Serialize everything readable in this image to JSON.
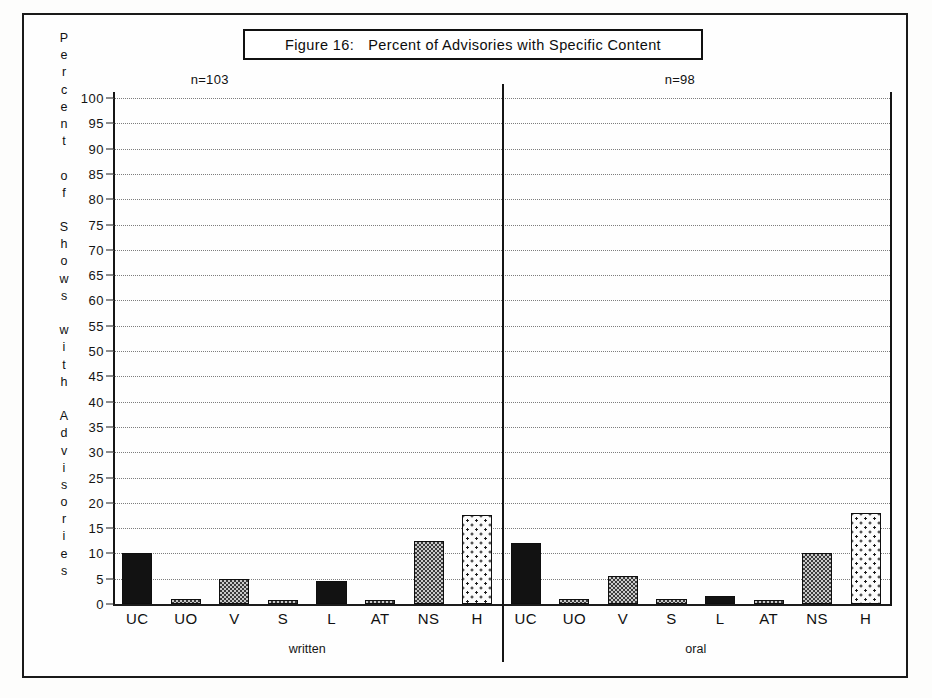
{
  "figure": {
    "frame_border_color": "#1a1a1a",
    "title_prefix": "Figure 16:",
    "title_main": "Percent of Advisories with Specific Content",
    "vertical_axis_caption": "Percent of Shows with Advisories",
    "vertical_axis_letters": [
      "P",
      "e",
      "r",
      "c",
      "e",
      "n",
      "t",
      "",
      "o",
      "f",
      "",
      "S",
      "h",
      "o",
      "w",
      "s",
      "",
      "w",
      "i",
      "t",
      "h",
      "",
      "A",
      "d",
      "v",
      "i",
      "s",
      "o",
      "r",
      "i",
      "e",
      "s"
    ]
  },
  "chart_data": {
    "type": "bar",
    "xlabel": "",
    "ylabel": "Percent of Shows with Advisories",
    "ylim": [
      0,
      100
    ],
    "ytick_step": 5,
    "yticks": [
      0,
      5,
      10,
      15,
      20,
      25,
      30,
      35,
      40,
      45,
      50,
      55,
      60,
      65,
      70,
      75,
      80,
      85,
      90,
      95,
      100
    ],
    "grid": true,
    "legend": "none",
    "categories": [
      "UC",
      "UO",
      "V",
      "S",
      "L",
      "AT",
      "NS",
      "H"
    ],
    "groups": [
      {
        "name": "written",
        "label": "written",
        "annotation": "n=103",
        "n": 103,
        "values": [
          10,
          1,
          5,
          0.7,
          4.5,
          0.5,
          12.5,
          17.5
        ],
        "fills": [
          "solid",
          "medium",
          "medium",
          "medium",
          "solid",
          "medium",
          "medium",
          "sparse"
        ]
      },
      {
        "name": "oral",
        "label": "oral",
        "annotation": "n=98",
        "n": 98,
        "values": [
          12,
          1,
          5.5,
          1,
          1.5,
          0,
          10,
          18
        ],
        "fills": [
          "solid",
          "medium",
          "medium",
          "medium",
          "solid",
          "medium",
          "medium",
          "sparse"
        ]
      }
    ],
    "colors": {
      "axis": "#151515",
      "gridline": "#7d7d7d",
      "bar_outline": "#0e0e0e",
      "fill_solid": "#121212",
      "fill_medium": "#c9c9c9",
      "fill_sparse": "#fbfbfb",
      "background": "#fefefe"
    }
  }
}
